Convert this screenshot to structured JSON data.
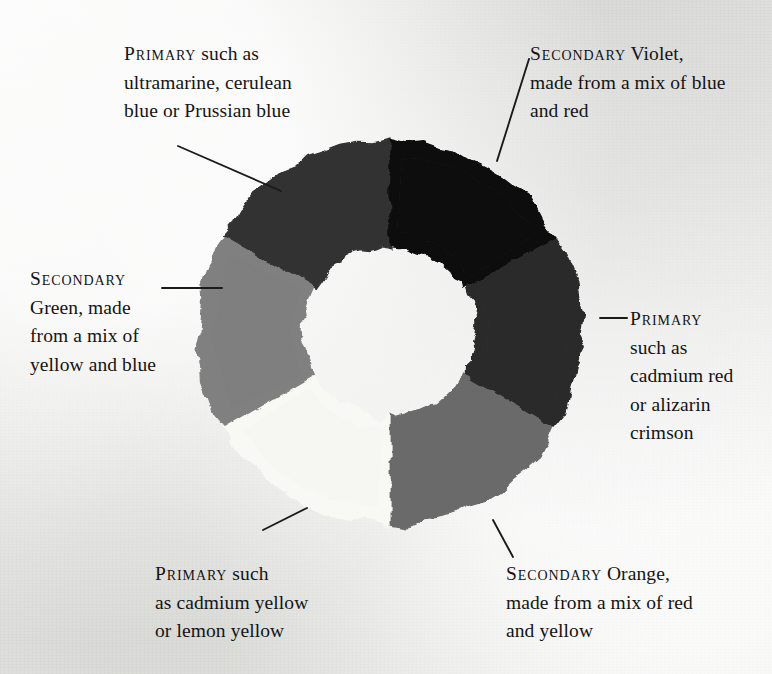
{
  "diagram": {
    "background_color": "#eeeeec",
    "center": {
      "x": 390,
      "y": 332
    },
    "outer_radius": 192,
    "inner_radius": 86,
    "line_color": "#1a1a1a"
  },
  "segments": [
    {
      "id": "blue",
      "name": "Primary blue",
      "kind": "Primary",
      "color": "#323232",
      "start_angle": 210,
      "end_angle": 270
    },
    {
      "id": "violet",
      "name": "Secondary violet",
      "kind": "Secondary",
      "color": "#0b0b0b",
      "start_angle": 270,
      "end_angle": 330
    },
    {
      "id": "red",
      "name": "Primary red",
      "kind": "Primary",
      "color": "#2b2b2b",
      "start_angle": 330,
      "end_angle": 30
    },
    {
      "id": "orange",
      "name": "Secondary orange",
      "kind": "Secondary",
      "color": "#6b6b6b",
      "start_angle": 30,
      "end_angle": 90
    },
    {
      "id": "yellow",
      "name": "Primary yellow",
      "kind": "Primary",
      "color": "#f8f8f5",
      "start_angle": 90,
      "end_angle": 150
    },
    {
      "id": "green",
      "name": "Secondary green",
      "kind": "Secondary",
      "color": "#808080",
      "start_angle": 150,
      "end_angle": 210
    }
  ],
  "labels": {
    "blue": {
      "lead": "Primary",
      "rest": " such as\nultramarine, cerulean\nblue or Prussian blue",
      "x": 124,
      "y": 40,
      "width": 250,
      "align": "left"
    },
    "violet": {
      "lead": "Secondary",
      "rest": " Violet,\nmade from a mix of blue\nand red",
      "x": 530,
      "y": 40,
      "width": 240,
      "align": "left"
    },
    "red": {
      "lead": "Primary",
      "rest": "\nsuch as\ncadmium red\nor alizarin\ncrimson",
      "x": 630,
      "y": 305,
      "width": 140,
      "align": "left"
    },
    "orange": {
      "lead": "Secondary",
      "rest": " Orange,\nmade from a mix of red\nand yellow",
      "x": 506,
      "y": 560,
      "width": 250,
      "align": "left"
    },
    "yellow": {
      "lead": "Primary",
      "rest": " such\nas cadmium yellow\nor lemon yellow",
      "x": 155,
      "y": 560,
      "width": 220,
      "align": "left"
    },
    "green": {
      "lead": "Secondary",
      "rest": "\nGreen, made\nfrom a mix of\nyellow and blue",
      "x": 30,
      "y": 265,
      "width": 170,
      "align": "left"
    }
  },
  "leaders": [
    {
      "id": "leader-blue",
      "x1": 178,
      "y1": 146,
      "x2": 281,
      "y2": 191
    },
    {
      "id": "leader-violet",
      "x1": 529,
      "y1": 59,
      "x2": 497,
      "y2": 161
    },
    {
      "id": "leader-red",
      "x1": 600,
      "y1": 318,
      "x2": 627,
      "y2": 318
    },
    {
      "id": "leader-orange",
      "x1": 493,
      "y1": 520,
      "x2": 513,
      "y2": 557
    },
    {
      "id": "leader-yellow",
      "x1": 263,
      "y1": 530,
      "x2": 307,
      "y2": 508
    },
    {
      "id": "leader-green",
      "x1": 162,
      "y1": 288,
      "x2": 222,
      "y2": 288
    }
  ]
}
